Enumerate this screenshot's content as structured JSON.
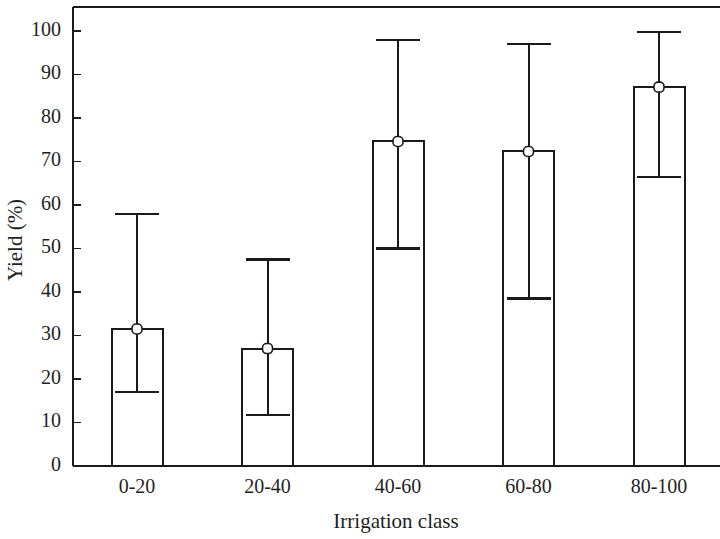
{
  "chart_data": {
    "type": "bar",
    "title": "",
    "xlabel": "Irrigation class",
    "ylabel": "Yield (%)",
    "categories": [
      "0-20",
      "20-40",
      "40-60",
      "60-80",
      "80-100"
    ],
    "values": [
      31.5,
      27.0,
      74.6,
      72.3,
      87.1
    ],
    "error_upper": [
      58.0,
      47.5,
      98.0,
      97.0,
      99.8
    ],
    "error_lower": [
      17.0,
      11.7,
      50.0,
      38.5,
      66.5
    ],
    "ylim": [
      0,
      105
    ],
    "ytick_labels": [
      "0",
      "10",
      "20",
      "30",
      "40",
      "50",
      "60",
      "70",
      "80",
      "90",
      "100"
    ],
    "ytick_values": [
      0,
      10,
      20,
      30,
      40,
      50,
      60,
      70,
      80,
      90,
      100
    ],
    "grid": false,
    "legend": "none",
    "bar_fill_color": "#ffffff",
    "line_color": "#1a1a1a",
    "background_color": "#ffffff",
    "marker_style": "open-square"
  }
}
